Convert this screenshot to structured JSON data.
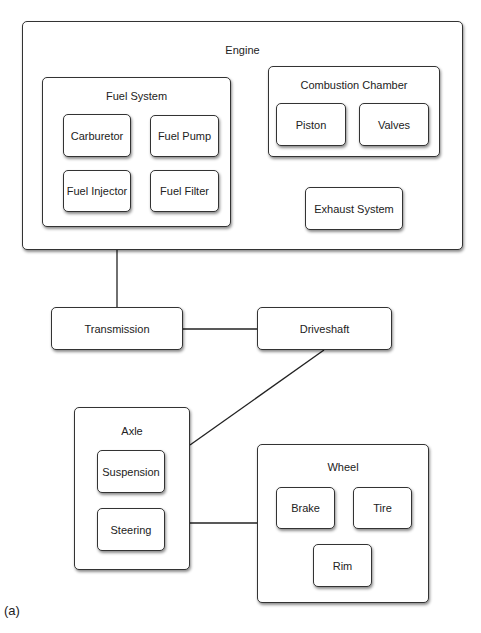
{
  "diagram": {
    "engine": {
      "title": "Engine",
      "fuel_system": {
        "title": "Fuel System",
        "items": [
          "Carburetor",
          "Fuel Pump",
          "Fuel Injector",
          "Fuel Filter"
        ]
      },
      "combustion_chamber": {
        "title": "Combustion Chamber",
        "items": [
          "Piston",
          "Valves"
        ]
      },
      "exhaust_system": "Exhaust System"
    },
    "transmission": "Transmission",
    "driveshaft": "Driveshaft",
    "axle": {
      "title": "Axle",
      "items": [
        "Suspension",
        "Steering"
      ]
    },
    "wheel": {
      "title": "Wheel",
      "items": [
        "Brake",
        "Tire",
        "Rim"
      ]
    },
    "connections": [
      [
        "Fuel System",
        "Combustion Chamber"
      ],
      [
        "Combustion Chamber",
        "Exhaust System"
      ],
      [
        "Engine",
        "Transmission"
      ],
      [
        "Transmission",
        "Driveshaft"
      ],
      [
        "Driveshaft",
        "Axle"
      ],
      [
        "Axle",
        "Wheel"
      ]
    ],
    "caption": "(a)"
  }
}
